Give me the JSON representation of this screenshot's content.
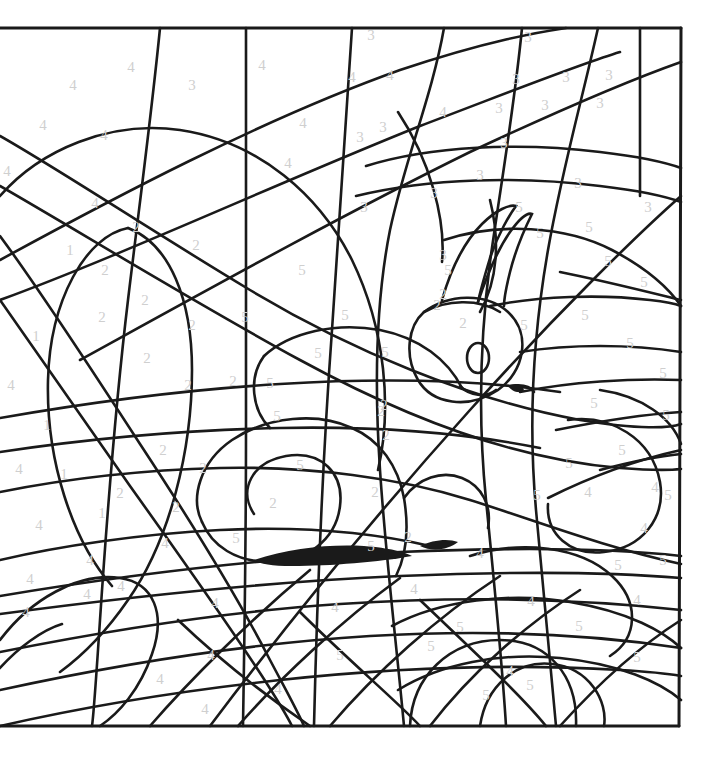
{
  "page": {
    "kind": "color-by-number-worksheet",
    "width": 715,
    "height": 759,
    "background_color": "#ffffff",
    "line_color": "#1a1a1a",
    "number_color": "#cfcfcf",
    "frame": {
      "left": 0,
      "top": 28,
      "right": 681,
      "bottom": 726
    }
  },
  "legend": {
    "numbers_used": [
      "1",
      "2",
      "3",
      "4",
      "5"
    ],
    "count_total": 115
  },
  "subject_parts": [
    {
      "name": "squirrel-head",
      "label": "head"
    },
    {
      "name": "squirrel-ear-left",
      "label": "ear"
    },
    {
      "name": "squirrel-ear-right",
      "label": "ear"
    },
    {
      "name": "squirrel-eye",
      "label": "eye"
    },
    {
      "name": "squirrel-nose",
      "label": "nose"
    },
    {
      "name": "squirrel-mouth",
      "label": "mouth"
    },
    {
      "name": "squirrel-body",
      "label": "body"
    },
    {
      "name": "squirrel-tail",
      "label": "tail"
    },
    {
      "name": "tree-branch",
      "label": "branch"
    },
    {
      "name": "branch-shadow",
      "label": "shadow"
    }
  ],
  "numbers": [
    {
      "v": "4",
      "x": 131,
      "y": 72
    },
    {
      "v": "4",
      "x": 73,
      "y": 90
    },
    {
      "v": "3",
      "x": 192,
      "y": 90
    },
    {
      "v": "3",
      "x": 371,
      "y": 40
    },
    {
      "v": "3",
      "x": 528,
      "y": 42
    },
    {
      "v": "3",
      "x": 516,
      "y": 84
    },
    {
      "v": "3",
      "x": 566,
      "y": 82
    },
    {
      "v": "3",
      "x": 609,
      "y": 80
    },
    {
      "v": "4",
      "x": 43,
      "y": 130
    },
    {
      "v": "4",
      "x": 104,
      "y": 140
    },
    {
      "v": "4",
      "x": 390,
      "y": 80
    },
    {
      "v": "4",
      "x": 443,
      "y": 117
    },
    {
      "v": "3",
      "x": 499,
      "y": 113
    },
    {
      "v": "3",
      "x": 545,
      "y": 110
    },
    {
      "v": "3",
      "x": 600,
      "y": 108
    },
    {
      "v": "4",
      "x": 303,
      "y": 128
    },
    {
      "v": "3",
      "x": 360,
      "y": 142
    },
    {
      "v": "3",
      "x": 383,
      "y": 132
    },
    {
      "v": "4",
      "x": 7,
      "y": 176
    },
    {
      "v": "4",
      "x": 288,
      "y": 168
    },
    {
      "v": "3",
      "x": 504,
      "y": 148
    },
    {
      "v": "4",
      "x": 95,
      "y": 208
    },
    {
      "v": "2",
      "x": 136,
      "y": 232
    },
    {
      "v": "2",
      "x": 196,
      "y": 250
    },
    {
      "v": "3",
      "x": 364,
      "y": 212
    },
    {
      "v": "3",
      "x": 434,
      "y": 198
    },
    {
      "v": "5",
      "x": 519,
      "y": 212
    },
    {
      "v": "3",
      "x": 578,
      "y": 188
    },
    {
      "v": "3",
      "x": 648,
      "y": 212
    },
    {
      "v": "1",
      "x": 70,
      "y": 255
    },
    {
      "v": "2",
      "x": 105,
      "y": 275
    },
    {
      "v": "5",
      "x": 302,
      "y": 275
    },
    {
      "v": "5",
      "x": 540,
      "y": 238
    },
    {
      "v": "5",
      "x": 589,
      "y": 232
    },
    {
      "v": "5",
      "x": 608,
      "y": 266
    },
    {
      "v": "2",
      "x": 102,
      "y": 322
    },
    {
      "v": "2",
      "x": 145,
      "y": 305
    },
    {
      "v": "2",
      "x": 192,
      "y": 330
    },
    {
      "v": "5",
      "x": 245,
      "y": 322
    },
    {
      "v": "5",
      "x": 345,
      "y": 320
    },
    {
      "v": "2",
      "x": 437,
      "y": 310
    },
    {
      "v": "2",
      "x": 463,
      "y": 328
    },
    {
      "v": "5",
      "x": 524,
      "y": 330
    },
    {
      "v": "5",
      "x": 585,
      "y": 320
    },
    {
      "v": "1",
      "x": 36,
      "y": 341
    },
    {
      "v": "2",
      "x": 147,
      "y": 363
    },
    {
      "v": "5",
      "x": 318,
      "y": 358
    },
    {
      "v": "5",
      "x": 385,
      "y": 357
    },
    {
      "v": "5",
      "x": 630,
      "y": 348
    },
    {
      "v": "4",
      "x": 11,
      "y": 390
    },
    {
      "v": "2",
      "x": 188,
      "y": 390
    },
    {
      "v": "2",
      "x": 233,
      "y": 386
    },
    {
      "v": "5",
      "x": 663,
      "y": 378
    },
    {
      "v": "2",
      "x": 381,
      "y": 416
    },
    {
      "v": "5",
      "x": 277,
      "y": 421
    },
    {
      "v": "5",
      "x": 594,
      "y": 408
    },
    {
      "v": "1",
      "x": 47,
      "y": 430
    },
    {
      "v": "2",
      "x": 163,
      "y": 455
    },
    {
      "v": "2",
      "x": 203,
      "y": 473
    },
    {
      "v": "5",
      "x": 569,
      "y": 468
    },
    {
      "v": "5",
      "x": 622,
      "y": 455
    },
    {
      "v": "4",
      "x": 19,
      "y": 474
    },
    {
      "v": "1",
      "x": 64,
      "y": 479
    },
    {
      "v": "2",
      "x": 273,
      "y": 508
    },
    {
      "v": "2",
      "x": 375,
      "y": 497
    },
    {
      "v": "5",
      "x": 537,
      "y": 500
    },
    {
      "v": "4",
      "x": 655,
      "y": 492
    },
    {
      "v": "4",
      "x": 39,
      "y": 530
    },
    {
      "v": "1",
      "x": 102,
      "y": 518
    },
    {
      "v": "2",
      "x": 176,
      "y": 512
    },
    {
      "v": "5",
      "x": 236,
      "y": 543
    },
    {
      "v": "2",
      "x": 408,
      "y": 542
    },
    {
      "v": "5",
      "x": 371,
      "y": 551
    },
    {
      "v": "4",
      "x": 480,
      "y": 558
    },
    {
      "v": "4",
      "x": 644,
      "y": 533
    },
    {
      "v": "4",
      "x": 165,
      "y": 548
    },
    {
      "v": "4",
      "x": 90,
      "y": 565
    },
    {
      "v": "5",
      "x": 618,
      "y": 570
    },
    {
      "v": "4",
      "x": 121,
      "y": 591
    },
    {
      "v": "4",
      "x": 30,
      "y": 584
    },
    {
      "v": "4",
      "x": 87,
      "y": 599
    },
    {
      "v": "4",
      "x": 26,
      "y": 617
    },
    {
      "v": "4",
      "x": 215,
      "y": 608
    },
    {
      "v": "4",
      "x": 414,
      "y": 594
    },
    {
      "v": "4",
      "x": 531,
      "y": 606
    },
    {
      "v": "4",
      "x": 637,
      "y": 605
    },
    {
      "v": "4",
      "x": 335,
      "y": 612
    },
    {
      "v": "4",
      "x": 211,
      "y": 660
    },
    {
      "v": "5",
      "x": 340,
      "y": 660
    },
    {
      "v": "5",
      "x": 460,
      "y": 632
    },
    {
      "v": "5",
      "x": 579,
      "y": 631
    },
    {
      "v": "5",
      "x": 637,
      "y": 662
    },
    {
      "v": "4",
      "x": 160,
      "y": 684
    },
    {
      "v": "4",
      "x": 278,
      "y": 694
    },
    {
      "v": "4",
      "x": 205,
      "y": 714
    },
    {
      "v": "4",
      "x": 510,
      "y": 676
    },
    {
      "v": "5",
      "x": 486,
      "y": 700
    },
    {
      "v": "5",
      "x": 530,
      "y": 690
    },
    {
      "v": "5",
      "x": 431,
      "y": 651
    },
    {
      "v": "2",
      "x": 384,
      "y": 410
    },
    {
      "v": "5",
      "x": 270,
      "y": 388
    },
    {
      "v": "5",
      "x": 448,
      "y": 275
    },
    {
      "v": "3",
      "x": 443,
      "y": 260
    },
    {
      "v": "2",
      "x": 443,
      "y": 299
    },
    {
      "v": "5",
      "x": 666,
      "y": 420
    },
    {
      "v": "5",
      "x": 668,
      "y": 500
    },
    {
      "v": "5",
      "x": 663,
      "y": 565
    },
    {
      "v": "2",
      "x": 386,
      "y": 440
    },
    {
      "v": "4",
      "x": 352,
      "y": 82
    },
    {
      "v": "3",
      "x": 480,
      "y": 180
    },
    {
      "v": "5",
      "x": 300,
      "y": 470
    },
    {
      "v": "2",
      "x": 120,
      "y": 498
    },
    {
      "v": "4",
      "x": 262,
      "y": 70
    },
    {
      "v": "5",
      "x": 644,
      "y": 287
    },
    {
      "v": "4",
      "x": 588,
      "y": 497
    }
  ]
}
